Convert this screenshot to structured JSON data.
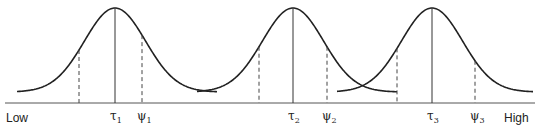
{
  "diagram": {
    "type": "overlapping-normal-distributions",
    "axis": {
      "low_label": "Low",
      "high_label": "High"
    },
    "curves": [
      {
        "name": "curve-1",
        "tau_label": "τ",
        "tau_sub": "1",
        "psi_label": "ψ",
        "psi_sub": "1",
        "center": 115,
        "lower_dash": 79,
        "upper_dash": 142,
        "left_end": 17,
        "right_end": 217
      },
      {
        "name": "curve-2",
        "tau_label": "τ",
        "tau_sub": "2",
        "psi_label": "ψ",
        "psi_sub": "2",
        "center": 293,
        "lower_dash": 259,
        "upper_dash": 327,
        "left_end": 197,
        "right_end": 397
      },
      {
        "name": "curve-3",
        "tau_label": "τ",
        "tau_sub": "3",
        "psi_label": "ψ",
        "psi_sub": "3",
        "center": 432,
        "lower_dash": 397,
        "upper_dash": 475,
        "left_end": 337,
        "right_end": 533
      }
    ]
  }
}
